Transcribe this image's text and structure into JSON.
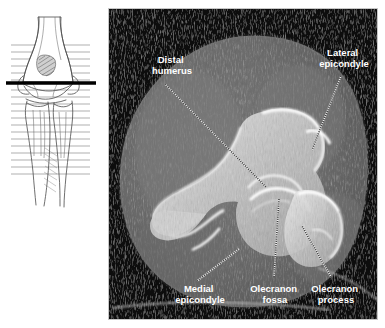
{
  "figure": {
    "panels": {
      "locator": {
        "name": "elbow-line-drawing-locator",
        "view": "anteroposterior elbow line drawing",
        "scan_line_label": "axial slice level indicator",
        "scan_line_color": "#000000",
        "grid_line_color": "#a9a9a9",
        "background": "#ffffff"
      },
      "ct": {
        "name": "axial-ct-image",
        "modality": "CT",
        "plane": "axial",
        "border_color": "#bdbdbd",
        "background": "#050505",
        "soft_tissue_color": "#6e6e6e",
        "bone_color": "#f2f2f2"
      }
    },
    "annotations": [
      {
        "id": "distal-humerus",
        "label_lines": [
          "Distal",
          "humerus"
        ],
        "text_x": 172,
        "text_y": 63,
        "leader": {
          "x1": 165,
          "y1": 84,
          "x2": 266,
          "y2": 187
        }
      },
      {
        "id": "lateral-epicondyle",
        "label_lines": [
          "Lateral",
          "epicondyle"
        ],
        "text_x": 344,
        "text_y": 56,
        "leader": {
          "x1": 341,
          "y1": 76,
          "x2": 312,
          "y2": 150
        }
      },
      {
        "id": "medial-epicondyle",
        "label_lines": [
          "Medial",
          "epicondyle"
        ],
        "text_x": 200,
        "text_y": 292,
        "leader": {
          "x1": 197,
          "y1": 281,
          "x2": 239,
          "y2": 249
        }
      },
      {
        "id": "olecranon-fossa",
        "label_lines": [
          "Olecranon",
          "fossa"
        ],
        "text_x": 275,
        "text_y": 292,
        "leader": {
          "x1": 274,
          "y1": 277,
          "x2": 279,
          "y2": 199
        }
      },
      {
        "id": "olecranon-process",
        "label_lines": [
          "Olecranon",
          "process"
        ],
        "text_x": 336,
        "text_y": 292,
        "leader": {
          "x1": 331,
          "y1": 277,
          "x2": 302,
          "y2": 226
        }
      }
    ]
  }
}
